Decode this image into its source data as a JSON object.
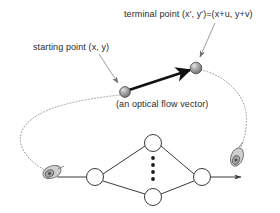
{
  "figure": {
    "background_color": "#ffffff",
    "labels": {
      "terminal_point": "terminal point (x', y')=(x+u, y+v)",
      "starting_point": "starting point (x, y)",
      "flow_vector_caption": "(an optical flow vector)"
    },
    "colors": {
      "text": "#2b2b2b",
      "vector_stroke": "#111111",
      "sphere_fill": "#8d8d8d",
      "sphere_highlight": "#d5d5d5",
      "sphere_edge": "#4a4a4a",
      "dotted_curve": "#9a9a9a",
      "network_stroke": "#3a3a3a",
      "node_fill": "#ffffff",
      "camera_body": "#b9b9b9",
      "camera_edge": "#6e6e6e",
      "leader_line": "#9c9c9c"
    },
    "vector": {
      "start_point": {
        "x": 125,
        "y": 92
      },
      "end_point": {
        "x": 196,
        "y": 68
      },
      "style": "thick-solid-arrow"
    },
    "leaders": [
      {
        "name": "starting-point-leader",
        "from": {
          "x": 100,
          "y": 55
        },
        "to": {
          "x": 119,
          "y": 84
        }
      },
      {
        "name": "terminal-point-leader",
        "from": {
          "x": 214,
          "y": 24
        },
        "to": {
          "x": 200,
          "y": 58
        }
      }
    ],
    "dotted_curves": [
      {
        "name": "left-epipolar-curve",
        "from_point": "starting-point-sphere",
        "to_point": "left-camera"
      },
      {
        "name": "right-epipolar-curve",
        "from_point": "terminal-point-sphere",
        "to_point": "right-camera"
      }
    ],
    "network": {
      "left_node": {
        "x": 95,
        "y": 177
      },
      "right_node": {
        "x": 202,
        "y": 177
      },
      "top_node": {
        "x": 153,
        "y": 143
      },
      "bottom_node": {
        "x": 153,
        "y": 197
      },
      "node_radius": 8.5,
      "ellipsis_dot_count": 4,
      "input_arrow": {
        "from": {
          "x": 57,
          "y": 177
        },
        "to": {
          "x": 86,
          "y": 177
        }
      },
      "output_arrow": {
        "from": {
          "x": 211,
          "y": 177
        },
        "to": {
          "x": 243,
          "y": 177
        }
      }
    },
    "cameras": [
      {
        "name": "left-camera",
        "x": 52,
        "y": 172
      },
      {
        "name": "right-camera",
        "x": 237,
        "y": 157
      }
    ]
  }
}
